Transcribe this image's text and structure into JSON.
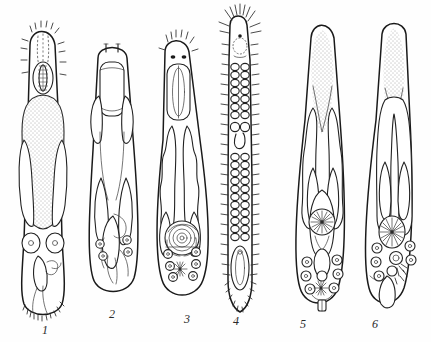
{
  "plate": {
    "title": "Comparative morphology plate of six parasitic worm specimens",
    "caption": "",
    "background_color": "#fefefe",
    "ink_color": "#1a1a1a",
    "width": 431,
    "height": 342,
    "style": "ink line drawing, stippled shading"
  },
  "figures": [
    {
      "id": "figure-1",
      "label": "1",
      "label_x": 45,
      "label_y": 330,
      "description": "Broad blunt-ended worm with setose anterior tip, oral sucker, large stippled pharyngeal mass, paired caeca and terminal spiny posterior",
      "features": [
        "anterior-setae",
        "oral-sucker",
        "pharynx-mass",
        "paired-caeca",
        "genital-complex",
        "spiny-tail"
      ]
    },
    {
      "id": "figure-2",
      "label": "2",
      "label_x": 112,
      "label_y": 315,
      "description": "Slender tapering worm with two apical papillae, large striated oral sucker, paired lateral glands and posterior reproductive organs",
      "features": [
        "apical-papillae",
        "striated-sucker",
        "lateral-glands",
        "paired-caeca",
        "genital-complex"
      ]
    },
    {
      "id": "figure-3",
      "label": "3",
      "label_x": 187,
      "label_y": 320,
      "description": "Lanceolate worm with crown of anterior setae, two eye-spots, elongate striated sucker, sinuous stippled caeca and coiled posterior organ with star-shaped gland",
      "features": [
        "anterior-setae",
        "eye-spots",
        "striated-sucker",
        "sinuous-caeca",
        "coiled-organ",
        "stellate-gland"
      ]
    },
    {
      "id": "figure-4",
      "label": "4",
      "label_x": 236,
      "label_y": 322,
      "description": "Very slender elongate worm with radiating apical crown of long setae, lateral bristle rows along the whole body and a ladder-like double chain of vesicles",
      "features": [
        "apical-seta-crown",
        "lateral-bristles",
        "vesicle-chains",
        "median-pore",
        "terminal-organ",
        "serrate-tail"
      ]
    },
    {
      "id": "figure-5",
      "label": "5",
      "label_x": 303,
      "label_y": 325,
      "description": "Elongate fusiform worm with stippled anterior field, long paired dotted caeca, large stellate-centred ovary, and posterior cluster of round eggs with star gland",
      "features": [
        "stippled-anterior",
        "dotted-caeca",
        "lateral-testes",
        "stellate-ovary",
        "egg-cluster",
        "stellate-gland",
        "terminal-organ"
      ]
    },
    {
      "id": "figure-6",
      "label": "6",
      "label_x": 375,
      "label_y": 325,
      "description": "Elongate worm with stippled anterior, single looping dotted caecum, stellate ovary, dark genital knot and posterior egg rows",
      "features": [
        "stippled-anterior",
        "looping-caecum",
        "lateral-testes",
        "stellate-ovary",
        "dark-genital-knot",
        "egg-rows",
        "terminal-sac"
      ]
    }
  ],
  "icons": {
    "stellate_gland": "star-gland-icon",
    "egg": "egg-icon",
    "sucker": "sucker-icon"
  }
}
